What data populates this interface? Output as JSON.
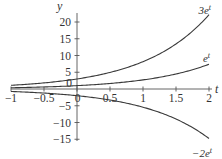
{
  "chart_data": {
    "type": "line",
    "title": "",
    "xlabel": "t",
    "ylabel": "y",
    "xlim": [
      -1,
      2
    ],
    "ylim": [
      -15,
      20
    ],
    "grid": false,
    "legend": "none (curves labeled inline at right end)",
    "x_ticks": [
      -1,
      -0.5,
      0,
      0.5,
      1,
      1.5,
      2
    ],
    "x_tick_labels": [
      "−1",
      "−0.5",
      "0",
      "0.5",
      "1",
      "1.5",
      "2"
    ],
    "y_ticks": [
      -15,
      -10,
      -5,
      0,
      5,
      10,
      15,
      20
    ],
    "y_tick_labels": [
      "−15",
      "−10",
      "−5",
      "0",
      "5",
      "10",
      "15",
      "20"
    ],
    "series": [
      {
        "name": "3e^t",
        "label": "3e",
        "label_sup": "t",
        "formula": "3*exp(t)",
        "x": [
          -1,
          -0.5,
          0,
          0.5,
          1,
          1.5,
          2
        ],
        "values": [
          1.1,
          1.82,
          3.0,
          4.95,
          8.15,
          13.45,
          22.17
        ]
      },
      {
        "name": "e^t",
        "label": "e",
        "label_sup": "t",
        "formula": "exp(t)",
        "x": [
          -1,
          -0.5,
          0,
          0.5,
          1,
          1.5,
          2
        ],
        "values": [
          0.37,
          0.61,
          1.0,
          1.65,
          2.72,
          4.48,
          7.39
        ]
      },
      {
        "name": "-2e^t",
        "label": "−2e",
        "label_sup": "t",
        "formula": "-2*exp(t)",
        "x": [
          -1,
          -0.5,
          0,
          0.5,
          1,
          1.5,
          2
        ],
        "values": [
          -0.74,
          -1.21,
          -2.0,
          -3.3,
          -5.44,
          -8.96,
          -14.78
        ]
      }
    ]
  },
  "axes": {
    "x_label": "t",
    "y_label": "y",
    "x_tick_labels": [
      "−1",
      "−0.5",
      "0",
      "0.5",
      "1",
      "1.5",
      "2"
    ],
    "y_tick_labels": [
      "−15",
      "−10",
      "−5",
      "0",
      "5",
      "10",
      "15",
      "20"
    ]
  },
  "curve_labels": {
    "three_et": {
      "base": "3e",
      "sup": "t"
    },
    "et": {
      "base": "e",
      "sup": "t"
    },
    "neg_two_et": {
      "base": "−2e",
      "sup": "t"
    }
  }
}
